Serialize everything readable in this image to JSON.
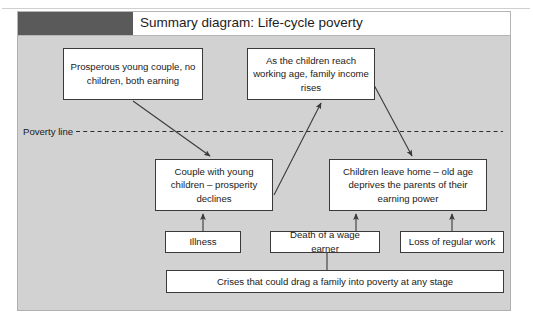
{
  "page": {
    "top_clipped_text": "· · · · · · · · · · · ·"
  },
  "header": {
    "title": "Summary diagram: Life-cycle poverty",
    "swatch_color": "#5a5a5a",
    "bar_background": "#ffffff"
  },
  "panel": {
    "background": "#d2d2d2",
    "border_color": "#b0b0b0"
  },
  "diagram": {
    "poverty_line_label": "Poverty line",
    "node_fill": "#ffffff",
    "node_border": "#3a3a3a",
    "connector_color": "#3a3a3a",
    "nodes": [
      {
        "id": "prosperous",
        "text": "Prosperous young couple, no children, both earning"
      },
      {
        "id": "children_reach",
        "text": "As the children reach working age, family income rises"
      },
      {
        "id": "couple_young",
        "text": "Couple with young children – prosperity declines"
      },
      {
        "id": "children_leave",
        "text": "Children leave home – old age deprives the parents of their earning power"
      },
      {
        "id": "illness",
        "text": "Illness"
      },
      {
        "id": "death_wage_earner",
        "text": "Death of a wage earner"
      },
      {
        "id": "loss_regular_work",
        "text": "Loss of regular work"
      },
      {
        "id": "crises",
        "text": "Crises that could drag a family into poverty at any stage"
      }
    ],
    "edges": [
      {
        "from": "prosperous",
        "to": "couple_young"
      },
      {
        "from": "couple_young",
        "to": "children_reach"
      },
      {
        "from": "children_reach",
        "to": "children_leave"
      },
      {
        "from": "illness",
        "to": "couple_young"
      },
      {
        "from": "death_wage_earner",
        "to": "children_leave"
      },
      {
        "from": "loss_regular_work",
        "to": "children_leave"
      },
      {
        "from": "crises",
        "to": "death_wage_earner"
      }
    ]
  }
}
